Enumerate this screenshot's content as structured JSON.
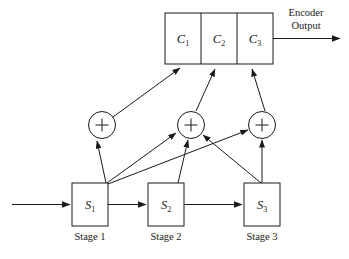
{
  "figure": {
    "type": "block-diagram",
    "background_color": "#ffffff",
    "line_color": "#1a1a1a"
  },
  "output_block": {
    "name": "encoder-output-register",
    "cells": [
      {
        "label": "C",
        "subscript": "1",
        "name": "codeword-cell-c1"
      },
      {
        "label": "C",
        "subscript": "2",
        "name": "codeword-cell-c2"
      },
      {
        "label": "C",
        "subscript": "3",
        "name": "codeword-cell-c3"
      }
    ]
  },
  "output_label": {
    "line1": "Encoder",
    "line2": "Output"
  },
  "adders": [
    {
      "name": "adder-1",
      "glyph": "+"
    },
    {
      "name": "adder-2",
      "glyph": "+"
    },
    {
      "name": "adder-3",
      "glyph": "+"
    }
  ],
  "stages": [
    {
      "label": "S",
      "subscript": "1",
      "caption": "Stage 1",
      "name": "stage-1"
    },
    {
      "label": "S",
      "subscript": "2",
      "caption": "Stage 2",
      "name": "stage-2"
    },
    {
      "label": "S",
      "subscript": "3",
      "caption": "Stage 3",
      "name": "stage-3"
    }
  ]
}
